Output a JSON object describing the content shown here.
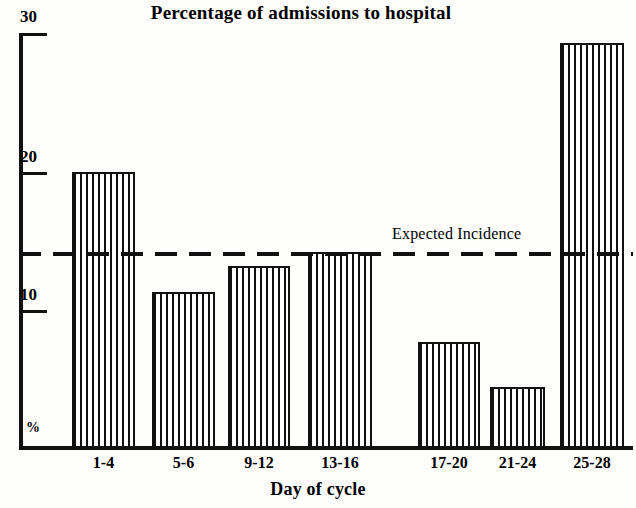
{
  "chart_data": {
    "type": "bar",
    "title": "Percentage of admissions to hospital",
    "xlabel": "Day of cycle",
    "ylabel": "%",
    "categories": [
      "1-4",
      "5-6",
      "9-12",
      "13-16",
      "17-20",
      "21-24",
      "25-28"
    ],
    "values": [
      20.0,
      11.3,
      13.2,
      14.2,
      7.7,
      4.4,
      29.3
    ],
    "ylim": [
      0,
      30
    ],
    "yticks": [
      10,
      20,
      30
    ],
    "ytick_labels": [
      "10",
      "20",
      "30"
    ],
    "grid": false,
    "legend": null,
    "annotations": [
      {
        "label": "Expected Incidence",
        "type": "horizontal-reference-line",
        "value": 14.0,
        "style": "dashed"
      }
    ]
  },
  "axis": {
    "y_unit_label": "%",
    "tick_30": "30",
    "tick_20": "20",
    "tick_10": "10"
  },
  "bars": [
    {
      "label": "1-4",
      "value": 20.0,
      "left": 72,
      "width": 63,
      "top": 172
    },
    {
      "label": "5-6",
      "value": 11.3,
      "left": 152,
      "width": 63,
      "top": 292
    },
    {
      "label": "9-12",
      "value": 13.2,
      "left": 228,
      "width": 62,
      "top": 266
    },
    {
      "label": "13-16",
      "value": 14.2,
      "left": 308,
      "width": 64,
      "top": 252
    },
    {
      "label": "17-20",
      "value": 7.7,
      "left": 418,
      "width": 62,
      "top": 342
    },
    {
      "label": "21-24",
      "value": 4.4,
      "left": 490,
      "width": 55,
      "top": 387
    },
    {
      "label": "25-28",
      "value": 29.3,
      "left": 560,
      "width": 64,
      "top": 43
    }
  ],
  "colors": {
    "ink": "#111111",
    "paper": "#fdfdfc"
  }
}
